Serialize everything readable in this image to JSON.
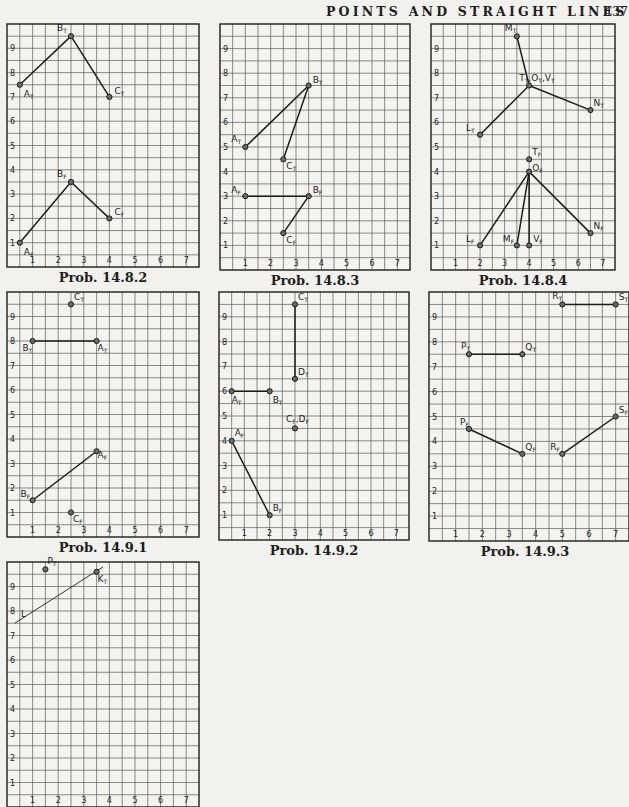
{
  "header": {
    "title": "POINTS AND STRAIGHT LINES",
    "page_number": "437"
  },
  "grid": {
    "x_range": [
      0,
      7.5
    ],
    "y_range": [
      0,
      10
    ],
    "x_ticks": [
      "1",
      "2",
      "3",
      "4",
      "5",
      "6",
      "7"
    ],
    "y_ticks": [
      "1",
      "2",
      "3",
      "4",
      "5",
      "6",
      "7",
      "8",
      "9"
    ]
  },
  "panels": [
    {
      "id": "p1",
      "caption": "Prob. 14.8.2",
      "box": {
        "left": 7,
        "top": 24,
        "width": 192,
        "height": 243
      },
      "points": [
        {
          "label": "A",
          "sub": "T",
          "x": 0.5,
          "y": 7.5,
          "lx": 4,
          "ly": 12
        },
        {
          "label": "B",
          "sub": "T",
          "x": 2.5,
          "y": 9.5,
          "lx": -14,
          "ly": -5
        },
        {
          "label": "C",
          "sub": "T",
          "x": 4,
          "y": 7,
          "lx": 5,
          "ly": -3
        },
        {
          "label": "A",
          "sub": "F",
          "x": 0.5,
          "y": 1,
          "lx": 4,
          "ly": 12
        },
        {
          "label": "B",
          "sub": "F",
          "x": 2.5,
          "y": 3.5,
          "lx": -14,
          "ly": -5
        },
        {
          "label": "C",
          "sub": "F",
          "x": 4,
          "y": 2,
          "lx": 5,
          "ly": -3
        }
      ],
      "lines": [
        [
          0,
          1
        ],
        [
          1,
          2
        ],
        [
          3,
          4
        ],
        [
          4,
          5
        ]
      ]
    },
    {
      "id": "p2",
      "caption": "Prob. 14.8.3",
      "box": {
        "left": 220,
        "top": 24,
        "width": 190,
        "height": 246
      },
      "points": [
        {
          "label": "A",
          "sub": "T",
          "x": 1,
          "y": 5,
          "lx": -14,
          "ly": -5
        },
        {
          "label": "B",
          "sub": "T",
          "x": 3.5,
          "y": 7.5,
          "lx": 4,
          "ly": -3
        },
        {
          "label": "C",
          "sub": "T",
          "x": 2.5,
          "y": 4.5,
          "lx": 3,
          "ly": 10
        },
        {
          "label": "A",
          "sub": "F",
          "x": 1,
          "y": 3,
          "lx": -14,
          "ly": -3
        },
        {
          "label": "B",
          "sub": "F",
          "x": 3.5,
          "y": 3,
          "lx": 4,
          "ly": -3
        },
        {
          "label": "C",
          "sub": "F",
          "x": 2.5,
          "y": 1.5,
          "lx": 3,
          "ly": 10
        }
      ],
      "lines": [
        [
          0,
          1
        ],
        [
          1,
          2
        ],
        [
          3,
          4
        ],
        [
          4,
          5
        ]
      ]
    },
    {
      "id": "p3",
      "caption": "Prob. 14.8.4",
      "box": {
        "left": 431,
        "top": 24,
        "width": 184,
        "height": 246
      },
      "points": [
        {
          "label": "M",
          "sub": "T",
          "x": 3.5,
          "y": 9.5,
          "lx": -12,
          "ly": -5
        },
        {
          "label": "T",
          "sub": "T",
          "x": 4,
          "y": 7.5,
          "lx": -10,
          "ly": -5,
          "extra": ",O",
          "extra_sub": "T",
          "extra2": ",V",
          "extra2_sub": "T"
        },
        {
          "label": "N",
          "sub": "T",
          "x": 6.5,
          "y": 6.5,
          "lx": 3,
          "ly": -4
        },
        {
          "label": "L",
          "sub": "T",
          "x": 2,
          "y": 5.5,
          "lx": -14,
          "ly": -4
        },
        {
          "label": "T",
          "sub": "F",
          "x": 4,
          "y": 4.5,
          "lx": 3,
          "ly": -4
        },
        {
          "label": "O",
          "sub": "F",
          "x": 4,
          "y": 4,
          "lx": 3,
          "ly": -1
        },
        {
          "label": "L",
          "sub": "F",
          "x": 2,
          "y": 1,
          "lx": -14,
          "ly": -3
        },
        {
          "label": "M",
          "sub": "F",
          "x": 3.5,
          "y": 1,
          "lx": -14,
          "ly": -3
        },
        {
          "label": "V",
          "sub": "F",
          "x": 4,
          "y": 1,
          "lx": 4,
          "ly": -3
        },
        {
          "label": "N",
          "sub": "F",
          "x": 6.5,
          "y": 1.5,
          "lx": 3,
          "ly": -4
        }
      ],
      "lines": [
        [
          0,
          1
        ],
        [
          1,
          2
        ],
        [
          1,
          3
        ],
        [
          5,
          6
        ],
        [
          5,
          7
        ],
        [
          5,
          8
        ],
        [
          5,
          9
        ]
      ]
    },
    {
      "id": "p4",
      "caption": "Prob. 14.9.1",
      "box": {
        "left": 7,
        "top": 292,
        "width": 192,
        "height": 245
      },
      "points": [
        {
          "label": "C",
          "sub": "T",
          "x": 2.5,
          "y": 9.5,
          "lx": 3,
          "ly": -4
        },
        {
          "label": "B",
          "sub": "T",
          "x": 1,
          "y": 8,
          "lx": -10,
          "ly": 10
        },
        {
          "label": "A",
          "sub": "T",
          "x": 3.5,
          "y": 8,
          "lx": 1,
          "ly": 10
        },
        {
          "label": "A",
          "sub": "F",
          "x": 3.5,
          "y": 3.5,
          "lx": 1,
          "ly": 7
        },
        {
          "label": "B",
          "sub": "F",
          "x": 1,
          "y": 1.5,
          "lx": -12,
          "ly": -3
        },
        {
          "label": "C",
          "sub": "F",
          "x": 2.5,
          "y": 1,
          "lx": 2,
          "ly": 9
        }
      ],
      "lines": [
        [
          1,
          2
        ],
        [
          3,
          4
        ]
      ]
    },
    {
      "id": "p5",
      "caption": "Prob. 14.9.2",
      "box": {
        "left": 219,
        "top": 292,
        "width": 190,
        "height": 248
      },
      "points": [
        {
          "label": "C",
          "sub": "T",
          "x": 3,
          "y": 9.5,
          "lx": 3,
          "ly": -4
        },
        {
          "label": "D",
          "sub": "T",
          "x": 3,
          "y": 6.5,
          "lx": 3,
          "ly": -4
        },
        {
          "label": "A",
          "sub": "T",
          "x": 0.5,
          "y": 6,
          "lx": 0,
          "ly": 12
        },
        {
          "label": "B",
          "sub": "T",
          "x": 2,
          "y": 6,
          "lx": 3,
          "ly": 12
        },
        {
          "label": "C",
          "sub": "F",
          "x": 3,
          "y": 4.5,
          "lx": -9,
          "ly": -6,
          "extra": ",D",
          "extra_sub": "F"
        },
        {
          "label": "A",
          "sub": "F",
          "x": 0.5,
          "y": 4,
          "lx": 3,
          "ly": -5
        },
        {
          "label": "B",
          "sub": "F",
          "x": 2,
          "y": 1,
          "lx": 3,
          "ly": -4
        }
      ],
      "lines": [
        [
          0,
          1
        ],
        [
          2,
          3
        ],
        [
          5,
          6
        ]
      ]
    },
    {
      "id": "p6",
      "caption": "Prob. 14.9.3",
      "box": {
        "left": 429,
        "top": 292,
        "width": 200,
        "height": 249
      },
      "points": [
        {
          "label": "R",
          "sub": "T",
          "x": 5,
          "y": 9.5,
          "lx": -10,
          "ly": -5
        },
        {
          "label": "S",
          "sub": "T",
          "x": 7,
          "y": 9.5,
          "lx": 3,
          "ly": -4
        },
        {
          "label": "P",
          "sub": "T",
          "x": 1.5,
          "y": 7.5,
          "lx": -8,
          "ly": -5
        },
        {
          "label": "Q",
          "sub": "T",
          "x": 3.5,
          "y": 7.5,
          "lx": 3,
          "ly": -4
        },
        {
          "label": "P",
          "sub": "F",
          "x": 1.5,
          "y": 4.5,
          "lx": -9,
          "ly": -4
        },
        {
          "label": "Q",
          "sub": "F",
          "x": 3.5,
          "y": 3.5,
          "lx": 3,
          "ly": -4
        },
        {
          "label": "R",
          "sub": "F",
          "x": 5,
          "y": 3.5,
          "lx": -12,
          "ly": -4
        },
        {
          "label": "S",
          "sub": "F",
          "x": 7,
          "y": 5,
          "lx": 3,
          "ly": -4
        }
      ],
      "lines": [
        [
          0,
          1
        ],
        [
          2,
          3
        ],
        [
          4,
          5
        ],
        [
          6,
          7
        ]
      ]
    },
    {
      "id": "p7",
      "caption": "",
      "box": {
        "left": 7,
        "top": 562,
        "width": 192,
        "height": 245
      },
      "points": [
        {
          "label": "P",
          "sub": "T",
          "x": 1.5,
          "y": 9.7,
          "lx": 2,
          "ly": -5
        },
        {
          "label": "K",
          "sub": "T",
          "x": 3.5,
          "y": 9.6,
          "lx": 1,
          "ly": 10
        }
      ],
      "lines": [],
      "thin_lines": [
        {
          "x1": 0.3,
          "y1": 7.5,
          "x2": 3.75,
          "y2": 9.8
        }
      ],
      "partial_labels": [
        {
          "text": "L",
          "x": 0.55,
          "y": 7.75
        }
      ]
    }
  ],
  "colors": {
    "paper": "#f2f1ed",
    "ink": "#1d1d1d",
    "grid": "#5a5a5a"
  }
}
